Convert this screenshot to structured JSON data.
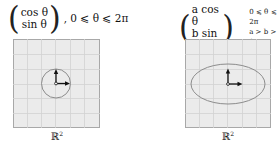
{
  "left": {
    "vector_top": "cos θ",
    "vector_bottom": "sin θ",
    "condition": ", 0 ⩽ θ ⩽ 2π",
    "space_label": "ℝ",
    "space_exp": "2",
    "shape": "circle"
  },
  "right": {
    "vector_top": "a cos θ",
    "vector_bottom": "b sin θ",
    "comma": ",",
    "condition_line1": "0 ⩽ θ ⩽ 2π",
    "condition_line2": "a > b > 0",
    "space_label": "ℝ",
    "space_exp": "2",
    "shape": "ellipse"
  },
  "colors": {
    "grid_bg": "#ebebeb",
    "grid_line": "#d2d2d2",
    "border": "#a8a8a8",
    "curve": "#8c8c8c",
    "arrow": "#111111"
  }
}
